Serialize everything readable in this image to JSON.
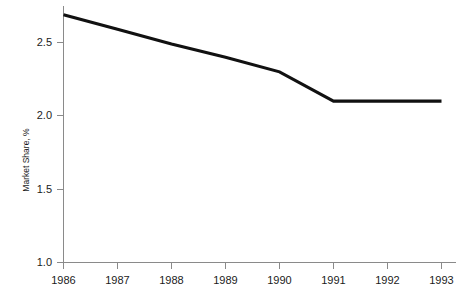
{
  "chart_data": {
    "type": "line",
    "title": "",
    "subtitle": "",
    "xlabel": "",
    "ylabel": "Market Share, %",
    "categories": [
      "1986",
      "1987",
      "1988",
      "1989",
      "1990",
      "1991",
      "1992",
      "1993"
    ],
    "x": [
      1986,
      1987,
      1988,
      1989,
      1990,
      1991,
      1992,
      1993
    ],
    "values": [
      2.69,
      2.59,
      2.49,
      2.4,
      2.3,
      2.1,
      2.1,
      2.1
    ],
    "series": [
      {
        "name": "Market Share",
        "values": [
          2.69,
          2.59,
          2.49,
          2.4,
          2.3,
          2.1,
          2.1,
          2.1
        ],
        "color": "#111111"
      }
    ],
    "xlim": [
      1986,
      1993
    ],
    "ylim": [
      1.0,
      2.75
    ],
    "yticks": [
      1.0,
      1.5,
      2.0,
      2.5
    ],
    "ytick_labels": [
      "1.0",
      "1.5",
      "2.0",
      "2.5"
    ],
    "xticks": [
      1986,
      1987,
      1988,
      1989,
      1990,
      1991,
      1992,
      1993
    ],
    "xtick_labels": [
      "1986",
      "1987",
      "1988",
      "1989",
      "1990",
      "1991",
      "1992",
      "1993"
    ],
    "grid": false,
    "legend": false,
    "legend_position": "none",
    "annotations": []
  },
  "axes": {
    "y_axis_title": "Market Share, %",
    "x_axis_title": ""
  },
  "colors": {
    "background": "#ffffff",
    "axis": "#8a8a8a",
    "text": "#1b1b1b",
    "series_line": "#111111"
  }
}
